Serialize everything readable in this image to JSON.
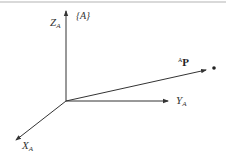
{
  "diagram": {
    "frame_label": "{A}",
    "axes": {
      "z": {
        "label": "Z",
        "subscript": "A"
      },
      "y": {
        "label": "Y",
        "subscript": "A"
      },
      "x": {
        "label": "X",
        "subscript": "A"
      }
    },
    "vector": {
      "superscript": "A",
      "label": "P"
    },
    "colors": {
      "ink": "#333333"
    }
  }
}
